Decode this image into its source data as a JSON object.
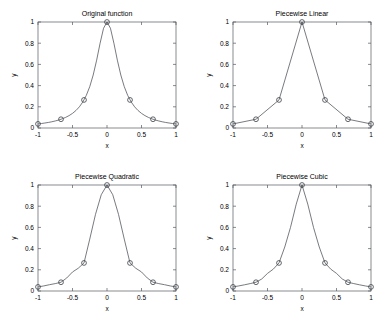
{
  "figure": {
    "background_color": "#ffffff",
    "axis_color": "#555a60",
    "curve_color": "#4a4f55",
    "marker_color": "#3c4046",
    "layout": "2x2-subplots"
  },
  "chart_data": [
    {
      "type": "line",
      "title": "Original function",
      "xlabel": "x",
      "ylabel": "y",
      "xlim": [
        -1,
        1
      ],
      "ylim": [
        0,
        1
      ],
      "xticks": [
        -1,
        -0.5,
        0,
        0.5,
        1
      ],
      "xticklabels": [
        "-1",
        "-0.5",
        "0",
        "0.5",
        "1"
      ],
      "yticks": [
        0,
        0.2,
        0.4,
        0.6,
        0.8,
        1
      ],
      "yticklabels": [
        "0",
        "0.2",
        "0.4",
        "0.6",
        "0.8",
        "1"
      ],
      "grid": false,
      "legend": "none",
      "series": [
        {
          "name": "runge-curve",
          "style": "solid-line",
          "x": [
            -1,
            -0.95,
            -0.9,
            -0.85,
            -0.8,
            -0.75,
            -0.7,
            -0.65,
            -0.6,
            -0.55,
            -0.5,
            -0.45,
            -0.4,
            -0.35,
            -0.3,
            -0.25,
            -0.2,
            -0.15,
            -0.1,
            -0.05,
            0,
            0.05,
            0.1,
            0.15,
            0.2,
            0.25,
            0.3,
            0.35,
            0.4,
            0.45,
            0.5,
            0.55,
            0.6,
            0.65,
            0.7,
            0.75,
            0.8,
            0.85,
            0.9,
            0.95,
            1
          ],
          "y": [
            0.0385,
            0.0424,
            0.0471,
            0.0525,
            0.0588,
            0.0664,
            0.0754,
            0.0864,
            0.1,
            0.1168,
            0.1379,
            0.1649,
            0.2,
            0.2462,
            0.3077,
            0.3902,
            0.5,
            0.64,
            0.8,
            0.9412,
            1,
            0.9412,
            0.8,
            0.64,
            0.5,
            0.3902,
            0.3077,
            0.2462,
            0.2,
            0.1649,
            0.1379,
            0.1168,
            0.1,
            0.0864,
            0.0754,
            0.0664,
            0.0588,
            0.0525,
            0.0471,
            0.0424,
            0.0385
          ]
        },
        {
          "name": "nodes",
          "style": "circle-markers",
          "x": [
            -1,
            -0.6667,
            -0.3333,
            0,
            0.3333,
            0.6667,
            1
          ],
          "y": [
            0.0385,
            0.0826,
            0.2647,
            1,
            0.2647,
            0.0826,
            0.0385
          ]
        }
      ]
    },
    {
      "type": "line",
      "title": "Piecewise Linear",
      "xlabel": "x",
      "ylabel": "y",
      "xlim": [
        -1,
        1
      ],
      "ylim": [
        0,
        1
      ],
      "xticks": [
        -1,
        -0.5,
        0,
        0.5,
        1
      ],
      "xticklabels": [
        "-1",
        "-0.5",
        "0",
        "0.5",
        "1"
      ],
      "yticks": [
        0,
        0.2,
        0.4,
        0.6,
        0.8,
        1
      ],
      "yticklabels": [
        "0",
        "0.2",
        "0.4",
        "0.6",
        "0.8",
        "1"
      ],
      "grid": false,
      "legend": "none",
      "series": [
        {
          "name": "interpolant",
          "style": "solid-line",
          "x": [
            -1,
            -0.6667,
            -0.3333,
            0,
            0.3333,
            0.6667,
            1
          ],
          "y": [
            0.0385,
            0.0826,
            0.2647,
            1,
            0.2647,
            0.0826,
            0.0385
          ]
        },
        {
          "name": "nodes",
          "style": "circle-markers",
          "x": [
            -1,
            -0.6667,
            -0.3333,
            0,
            0.3333,
            0.6667,
            1
          ],
          "y": [
            0.0385,
            0.0826,
            0.2647,
            1,
            0.2647,
            0.0826,
            0.0385
          ]
        }
      ]
    },
    {
      "type": "line",
      "title": "Piecewise Quadratic",
      "xlabel": "x",
      "ylabel": "y",
      "xlim": [
        -1,
        1
      ],
      "ylim": [
        0,
        1
      ],
      "xticks": [
        -1,
        -0.5,
        0,
        0.5,
        1
      ],
      "xticklabels": [
        "-1",
        "-0.5",
        "0",
        "0.5",
        "1"
      ],
      "yticks": [
        0,
        0.2,
        0.4,
        0.6,
        0.8,
        1
      ],
      "yticklabels": [
        "0",
        "0.2",
        "0.4",
        "0.6",
        "0.8",
        "1"
      ],
      "grid": false,
      "legend": "none",
      "series": [
        {
          "name": "interpolant",
          "style": "solid-line",
          "x": [
            -1,
            -0.9167,
            -0.8333,
            -0.75,
            -0.6667,
            -0.5833,
            -0.5,
            -0.4167,
            -0.3333,
            -0.25,
            -0.1667,
            -0.0833,
            0,
            0.0833,
            0.1667,
            0.25,
            0.3333,
            0.4167,
            0.5,
            0.5833,
            0.6667,
            0.75,
            0.8333,
            0.9167,
            1
          ],
          "y": [
            0.0385,
            0.0478,
            0.0594,
            0.0698,
            0.0826,
            0.123,
            0.1795,
            0.2148,
            0.2647,
            0.4899,
            0.7233,
            0.9083,
            1,
            0.9083,
            0.7233,
            0.4899,
            0.2647,
            0.2148,
            0.1795,
            0.123,
            0.0826,
            0.0698,
            0.0594,
            0.0478,
            0.0385
          ]
        },
        {
          "name": "nodes",
          "style": "circle-markers",
          "x": [
            -1,
            -0.6667,
            -0.3333,
            0,
            0.3333,
            0.6667,
            1
          ],
          "y": [
            0.0385,
            0.0826,
            0.2647,
            1,
            0.2647,
            0.0826,
            0.0385
          ]
        }
      ]
    },
    {
      "type": "line",
      "title": "Piecewise Cubic",
      "xlabel": "x",
      "ylabel": "y",
      "xlim": [
        -1,
        1
      ],
      "ylim": [
        0,
        1
      ],
      "xticks": [
        -1,
        -0.5,
        0,
        0.5,
        1
      ],
      "xticklabels": [
        "-1",
        "-0.5",
        "0",
        "0.5",
        "1"
      ],
      "yticks": [
        0,
        0.2,
        0.4,
        0.6,
        0.8,
        1
      ],
      "yticklabels": [
        "0",
        "0.2",
        "0.4",
        "0.6",
        "0.8",
        "1"
      ],
      "grid": false,
      "legend": "none",
      "series": [
        {
          "name": "interpolant",
          "style": "solid-line",
          "x": [
            -1,
            -0.9167,
            -0.8333,
            -0.75,
            -0.6667,
            -0.5833,
            -0.5,
            -0.4167,
            -0.3333,
            -0.25,
            -0.1667,
            -0.0833,
            0,
            0.0833,
            0.1667,
            0.25,
            0.3333,
            0.4167,
            0.5,
            0.5833,
            0.6667,
            0.75,
            0.8333,
            0.9167,
            1
          ],
          "y": [
            0.0385,
            0.048,
            0.0585,
            0.07,
            0.0826,
            0.1135,
            0.166,
            0.206,
            0.2647,
            0.415,
            0.6,
            0.82,
            1,
            0.82,
            0.6,
            0.415,
            0.2647,
            0.206,
            0.166,
            0.1135,
            0.0826,
            0.07,
            0.0585,
            0.048,
            0.0385
          ]
        },
        {
          "name": "nodes",
          "style": "circle-markers",
          "x": [
            -1,
            -0.6667,
            -0.3333,
            0,
            0.3333,
            0.6667,
            1
          ],
          "y": [
            0.0385,
            0.0826,
            0.2647,
            1,
            0.2647,
            0.0826,
            0.0385
          ]
        }
      ]
    }
  ]
}
